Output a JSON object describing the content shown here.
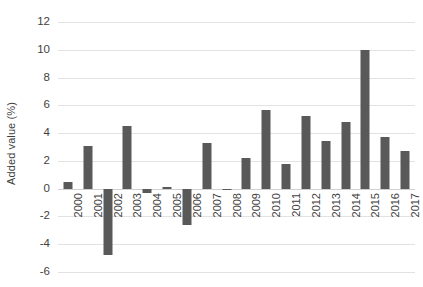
{
  "chart_data": {
    "type": "bar",
    "title": "",
    "subtitle": "",
    "xlabel": "",
    "ylabel": "Added value (%)",
    "categories": [
      "2000",
      "2001",
      "2002",
      "2003",
      "2004",
      "2005",
      "2006",
      "2007",
      "2008",
      "2009",
      "2010",
      "2011",
      "2012",
      "2013",
      "2014",
      "2015",
      "2016",
      "2017"
    ],
    "values": [
      0.5,
      3.1,
      -4.8,
      4.5,
      -0.3,
      0.1,
      -2.6,
      3.3,
      -0.1,
      2.2,
      5.7,
      1.75,
      5.2,
      3.4,
      4.8,
      10.0,
      3.7,
      2.7
    ],
    "series": [
      {
        "name": "Added value",
        "values": [
          0.5,
          3.1,
          -4.8,
          4.5,
          -0.3,
          0.1,
          -2.6,
          3.3,
          -0.1,
          2.2,
          5.7,
          1.75,
          5.2,
          3.4,
          4.8,
          10.0,
          3.7,
          2.7
        ]
      }
    ],
    "yticks": [
      12,
      10,
      8,
      6,
      4,
      2,
      0,
      -2,
      -4,
      -6
    ],
    "ytick_labels": [
      "12",
      "10",
      "8",
      "6",
      "4",
      "2",
      "0",
      "-2",
      "-4",
      "-6"
    ],
    "ylim": [
      -6,
      12
    ],
    "grid": true,
    "legend": false,
    "legend_position": "none",
    "bar_color": "#595959",
    "gridline_color": "#e2e2e2",
    "background_color": "#ffffff",
    "text_color": "#3f3f3f"
  }
}
